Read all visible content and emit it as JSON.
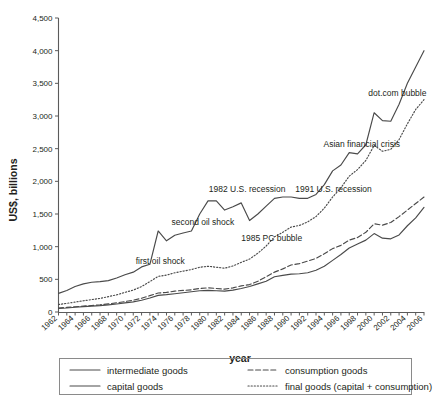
{
  "chart_data": {
    "type": "line",
    "title": "",
    "xlabel": "year",
    "ylabel": "US$, billions",
    "xlim": [
      1962,
      2006
    ],
    "ylim": [
      0,
      4500
    ],
    "grid": false,
    "legend_position": "bottom",
    "ytick_labels": [
      "0",
      "500",
      "1,000",
      "1,500",
      "2,000",
      "2,500",
      "3,000",
      "3,500",
      "4,000",
      "4,500"
    ],
    "ytick_values": [
      0,
      500,
      1000,
      1500,
      2000,
      2500,
      3000,
      3500,
      4000,
      4500
    ],
    "xtick_labels": [
      "1962",
      "1964",
      "1966",
      "1968",
      "1970",
      "1972",
      "1974",
      "1976",
      "1978",
      "1980",
      "1982",
      "1984",
      "1986",
      "1988",
      "1990",
      "1992",
      "1994",
      "1996",
      "1998",
      "2000",
      "2002",
      "2004",
      "2006"
    ],
    "x": [
      1962,
      1963,
      1964,
      1965,
      1966,
      1967,
      1968,
      1969,
      1970,
      1971,
      1972,
      1973,
      1974,
      1975,
      1976,
      1977,
      1978,
      1979,
      1980,
      1981,
      1982,
      1983,
      1984,
      1985,
      1986,
      1987,
      1988,
      1989,
      1990,
      1991,
      1992,
      1993,
      1994,
      1995,
      1996,
      1997,
      1998,
      1999,
      2000,
      2001,
      2002,
      2003,
      2004,
      2005,
      2006
    ],
    "series": [
      {
        "name": "intermediate goods",
        "style": "solid",
        "values": [
          285,
          330,
          390,
          430,
          455,
          465,
          480,
          520,
          570,
          610,
          690,
          730,
          1240,
          1090,
          1175,
          1210,
          1240,
          1500,
          1700,
          1700,
          1560,
          1610,
          1670,
          1400,
          1500,
          1620,
          1740,
          1760,
          1760,
          1740,
          1740,
          1800,
          1950,
          2160,
          2250,
          2440,
          2420,
          2560,
          3050,
          2930,
          2920,
          3180,
          3500,
          3750,
          4000
        ]
      },
      {
        "name": "consumption goods",
        "style": "dashed",
        "values": [
          60,
          70,
          80,
          90,
          100,
          110,
          125,
          140,
          160,
          180,
          210,
          250,
          290,
          300,
          320,
          330,
          340,
          360,
          370,
          360,
          350,
          370,
          400,
          420,
          470,
          540,
          610,
          660,
          720,
          740,
          780,
          820,
          890,
          970,
          1020,
          1100,
          1140,
          1220,
          1350,
          1330,
          1370,
          1460,
          1560,
          1660,
          1760
        ]
      },
      {
        "name": "capital goods",
        "style": "solid",
        "values": [
          55,
          62,
          72,
          82,
          90,
          98,
          110,
          122,
          140,
          155,
          180,
          215,
          255,
          265,
          280,
          295,
          310,
          325,
          330,
          325,
          320,
          335,
          360,
          390,
          430,
          470,
          540,
          560,
          580,
          585,
          600,
          640,
          700,
          790,
          880,
          980,
          1040,
          1100,
          1200,
          1130,
          1120,
          1180,
          1320,
          1440,
          1600
        ]
      },
      {
        "name": "final goods (capital + consumption)",
        "style": "dotted",
        "values": [
          115,
          132,
          152,
          172,
          190,
          208,
          235,
          262,
          300,
          335,
          390,
          465,
          545,
          565,
          600,
          625,
          650,
          685,
          700,
          685,
          670,
          705,
          760,
          810,
          900,
          1010,
          1150,
          1220,
          1300,
          1325,
          1380,
          1460,
          1590,
          1760,
          1900,
          2080,
          2180,
          2320,
          2550,
          2460,
          2490,
          2640,
          2880,
          3100,
          3250
        ]
      }
    ],
    "annotations": [
      {
        "text": "first oil shock",
        "x": 1971.3,
        "y": 730
      },
      {
        "text": "second oil shock",
        "x": 1975.6,
        "y": 1325
      },
      {
        "text": "1982 U.S. recession",
        "x": 1980.1,
        "y": 1840
      },
      {
        "text": "1985 PC bubble",
        "x": 1984.0,
        "y": 1080
      },
      {
        "text": "1991 U.S. recession",
        "x": 1990.5,
        "y": 1840
      },
      {
        "text": "Asian financial crisis",
        "x": 1993.9,
        "y": 2530
      },
      {
        "text": "dot.com bubble",
        "x": 1999.3,
        "y": 3310
      }
    ]
  },
  "legend": {
    "entries": [
      {
        "label": "intermediate goods",
        "style": "solid"
      },
      {
        "label": "consumption goods",
        "style": "dashed"
      },
      {
        "label": "capital goods",
        "style": "solid"
      },
      {
        "label": "final goods (capital + consumption)",
        "style": "dotted"
      }
    ]
  }
}
